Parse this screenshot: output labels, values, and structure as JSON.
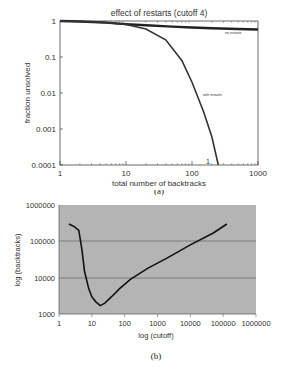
{
  "chart_data": [
    {
      "type": "line",
      "panel_caption": "(a)",
      "title": "effect of restarts (cutoff 4)",
      "xlabel": "total number of backtracks",
      "ylabel": "fraction unsolved",
      "xscale": "log",
      "yscale": "log",
      "xlim": [
        1,
        1000
      ],
      "ylim": [
        0.0001,
        1
      ],
      "x_ticks": [
        "1",
        "10",
        "100",
        "1000"
      ],
      "y_ticks": [
        "1",
        "0.1",
        "0.01",
        "0.001",
        "0.0001"
      ],
      "grid": false,
      "annotation": "1",
      "series": [
        {
          "name": "no restarts",
          "x": [
            1,
            2,
            5,
            10,
            20,
            50,
            100,
            200,
            500,
            1000
          ],
          "y": [
            1.0,
            0.97,
            0.9,
            0.82,
            0.76,
            0.7,
            0.66,
            0.63,
            0.6,
            0.58
          ]
        },
        {
          "name": "with restarts",
          "x": [
            1,
            2,
            5,
            10,
            20,
            40,
            70,
            100,
            150,
            200,
            250
          ],
          "y": [
            1.0,
            0.97,
            0.9,
            0.8,
            0.6,
            0.3,
            0.08,
            0.02,
            0.003,
            0.0006,
            0.0001
          ]
        }
      ]
    },
    {
      "type": "line",
      "panel_caption": "(b)",
      "title": "",
      "xlabel": "log (cutoff)",
      "ylabel": "log (backtracks)",
      "xscale": "log",
      "yscale": "log",
      "xlim": [
        1,
        1000000
      ],
      "ylim": [
        1000,
        1000000
      ],
      "x_ticks": [
        "1",
        "10",
        "100",
        "1000",
        "10000",
        "100000",
        "1000000"
      ],
      "y_ticks": [
        "1000000",
        "100000",
        "10000",
        "1000"
      ],
      "grid": true,
      "background": "#b4b4b4",
      "series": [
        {
          "name": "backtracks",
          "x": [
            2,
            3,
            4,
            5,
            6,
            8,
            10,
            13,
            18,
            25,
            40,
            70,
            150,
            500,
            2000,
            10000,
            50000,
            130000
          ],
          "y": [
            300000,
            250000,
            200000,
            60000,
            15000,
            5000,
            3000,
            2200,
            1700,
            2000,
            3000,
            5000,
            9000,
            18000,
            35000,
            80000,
            170000,
            300000
          ]
        }
      ]
    }
  ],
  "labels": {
    "a": {
      "title": "effect of restarts (cutoff 4)",
      "xlabel": "total number of backtracks",
      "ylabel": "fraction unsolved",
      "x_ticks": [
        "1",
        "10",
        "100",
        "1000"
      ],
      "y_ticks": [
        "1",
        "0.1",
        "0.01",
        "0.001",
        "0.0001"
      ],
      "series_no_restarts": "no restarts",
      "series_with_restarts": "with restarts",
      "annotation": "1",
      "caption": "(a)"
    },
    "b": {
      "xlabel": "log (cutoff)",
      "ylabel": "log (backtracks)",
      "x_ticks": [
        "1",
        "10",
        "100",
        "1000",
        "10000",
        "100000",
        "1000000"
      ],
      "y_ticks": [
        "1000000",
        "100000",
        "10000",
        "1000"
      ],
      "caption": "(b)"
    }
  }
}
